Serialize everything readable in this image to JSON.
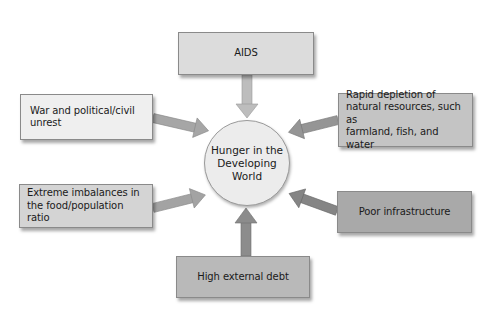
{
  "diagram": {
    "center": {
      "label": "Hunger in the Developing World",
      "lines": [
        "Hunger",
        "in the",
        "Developing",
        "World"
      ],
      "fill": "#ececec"
    },
    "causes": [
      {
        "id": "aids",
        "label": "AIDS",
        "lines": [
          "AIDS"
        ],
        "fill": "#dcdcdc",
        "arrow_color": "#bdbdbd",
        "position": "top"
      },
      {
        "id": "war",
        "label": "War and political/civil unrest",
        "lines": [
          "War and political/civil",
          "unrest"
        ],
        "fill": "#efefef",
        "arrow_color": "#a6a6a6",
        "position": "upper-left"
      },
      {
        "id": "rapid",
        "label": "Rapid depletion of natural resources, such as farmland, fish, and water",
        "lines": [
          "Rapid depletion of",
          "natural resources, such as",
          "farmland, fish, and water"
        ],
        "fill": "#c4c4c4",
        "arrow_color": "#959595",
        "position": "upper-right"
      },
      {
        "id": "extreme",
        "label": "Extreme imbalances in the food/population ratio",
        "lines": [
          "Extreme imbalances in",
          "the food/population ratio"
        ],
        "fill": "#d4d4d4",
        "arrow_color": "#a3a3a3",
        "position": "lower-left"
      },
      {
        "id": "poor",
        "label": "Poor infrastructure",
        "lines": [
          "Poor infrastructure"
        ],
        "fill": "#a9a9a9",
        "arrow_color": "#858585",
        "position": "lower-right"
      },
      {
        "id": "debt",
        "label": "High external debt",
        "lines": [
          "High external debt"
        ],
        "fill": "#b9b9b9",
        "arrow_color": "#8c8c8c",
        "position": "bottom"
      }
    ]
  }
}
